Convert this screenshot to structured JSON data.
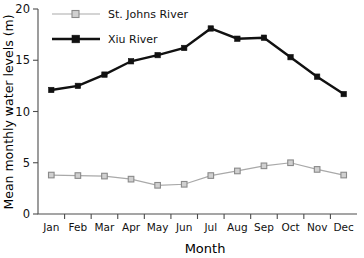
{
  "chart_data": {
    "type": "line",
    "title": "",
    "xlabel": "Month",
    "ylabel": "Mean monthly water levels (m)",
    "categories": [
      "Jan",
      "Feb",
      "Mar",
      "Apr",
      "May",
      "Jun",
      "Jul",
      "Aug",
      "Sep",
      "Oct",
      "Nov",
      "Dec"
    ],
    "xlim": [
      0,
      12
    ],
    "ylim": [
      0,
      20
    ],
    "yticks": [
      0,
      5,
      10,
      15,
      20
    ],
    "ytick_labels": [
      "0",
      "5",
      "10",
      "15",
      "20"
    ],
    "grid": false,
    "legend_position": "upper left",
    "series": [
      {
        "name": "St. Johns River",
        "marker": "open-square",
        "color": "#a9a9a9",
        "values": [
          3.8,
          3.75,
          3.7,
          3.4,
          2.8,
          2.9,
          3.75,
          4.2,
          4.7,
          5.0,
          4.35,
          3.8
        ]
      },
      {
        "name": "Xiu River",
        "marker": "filled-square",
        "color": "#111111",
        "values": [
          12.1,
          12.5,
          13.6,
          14.9,
          15.5,
          16.2,
          18.1,
          17.1,
          17.2,
          15.3,
          13.4,
          11.7
        ]
      }
    ]
  },
  "legend": {
    "entries": [
      {
        "label": "St. Johns River"
      },
      {
        "label": "Xiu River"
      }
    ]
  },
  "axes": {
    "x_title": "Month",
    "y_title": "Mean monthly water levels (m)"
  }
}
